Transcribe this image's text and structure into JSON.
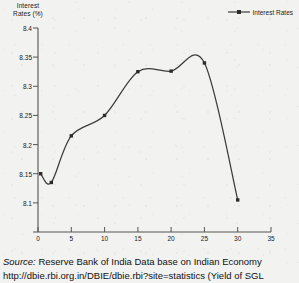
{
  "chart_data": {
    "type": "line",
    "title": "",
    "subtitle": "",
    "xlabel": "Maturity (in year)",
    "ylabel": "Interest Rates (%)",
    "ylabel_lines": [
      "Interest",
      "Rates (%)"
    ],
    "grid": false,
    "legend_position": "top-right",
    "legend": [
      "Interest Rates"
    ],
    "xlim": [
      0,
      35
    ],
    "ylim": [
      8.1,
      8.45
    ],
    "xticks": [
      0,
      5,
      10,
      15,
      20,
      25,
      30,
      35
    ],
    "xtick_labels": [
      "0",
      "5",
      "10",
      "15",
      "20",
      "25",
      "30",
      "35"
    ],
    "yticks": [
      8.1,
      8.15,
      8.2,
      8.25,
      8.3,
      8.35,
      8.4,
      8.45
    ],
    "ytick_labels": [
      "8.1",
      "8.15",
      "8.2",
      "8.25",
      "8.3",
      "8.35",
      "8.4",
      "8.45"
    ],
    "ytick_labels_shown": [
      "8.15",
      "8.2",
      "8.25",
      "8.3",
      "8.35",
      "8.4",
      "8.45"
    ],
    "series": [
      {
        "name": "Interest Rates",
        "color": "#3b3b3b",
        "marker": "square",
        "x": [
          0.4,
          2,
          5,
          10,
          15,
          20,
          25,
          30
        ],
        "values": [
          8.2,
          8.185,
          8.265,
          8.3,
          8.375,
          8.376,
          8.39,
          8.155
        ]
      }
    ]
  },
  "legend": {
    "entries": [
      {
        "label": "Interest Rates",
        "color": "#3b3b3b"
      }
    ]
  },
  "axes": {
    "y_title_line1": "Interest",
    "y_title_line2": "Rates (%)",
    "x_title": "Maturity (in year)"
  },
  "footer": {
    "source_keyword": "Source:",
    "source_text": " Reserve Bank of India Data base on Indian Economy",
    "url_line": "http://dbie.rbi.org.in/DBIE/dbie.rbi?site=statistics (Yield of SGL"
  },
  "colors": {
    "page_background": "#f2f2f0",
    "axis": "#555555",
    "line": "#3b3b3b",
    "text": "#1a1a1a"
  }
}
